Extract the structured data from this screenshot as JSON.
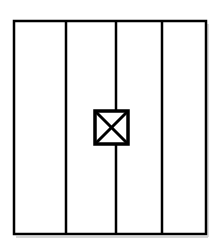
{
  "figure": {
    "type": "line-drawing",
    "canvas": {
      "width": 219,
      "height": 243,
      "background": "#ffffff"
    },
    "colors": {
      "stroke": "#000000",
      "fill": "#ffffff",
      "shadow": "#b5b5b5"
    }
  },
  "outer_rectangle": {
    "label": "outer frame",
    "x": 14,
    "y": 21,
    "width": 192,
    "height": 213,
    "stroke_width": 2.5,
    "fill": "#ffffff"
  },
  "dividers": [
    {
      "label": "divider 1",
      "x": 66,
      "y1": 21,
      "y2": 234,
      "stroke_width": 2.5
    },
    {
      "label": "divider 2",
      "x": 116,
      "y1": 21,
      "y2": 234,
      "stroke_width": 2.5
    },
    {
      "label": "divider 3",
      "x": 162,
      "y1": 21,
      "y2": 234,
      "stroke_width": 2.5
    }
  ],
  "panels": [
    {
      "label": "panel 1",
      "x": 14,
      "width": 52
    },
    {
      "label": "panel 2",
      "x": 66,
      "width": 50
    },
    {
      "label": "panel 3",
      "x": 116,
      "width": 46
    },
    {
      "label": "panel 4",
      "x": 162,
      "width": 44
    }
  ],
  "crossed_box": {
    "label": "crossed box symbol",
    "x": 95,
    "y": 111,
    "width": 33,
    "height": 33,
    "stroke_width": 3.5,
    "fill": "#ffffff",
    "diagonals": [
      {
        "label": "diagonal top-left to bottom-right",
        "x1": 95,
        "y1": 111,
        "x2": 128,
        "y2": 144
      },
      {
        "label": "diagonal top-right to bottom-left",
        "x1": 128,
        "y1": 111,
        "x2": 95,
        "y2": 144
      }
    ],
    "diagonal_stroke_width": 3
  },
  "shadow_artifact": {
    "label": "scan shadow",
    "x": 14,
    "y": 236,
    "width": 192,
    "height": 2,
    "color": "#cfcfcf"
  }
}
